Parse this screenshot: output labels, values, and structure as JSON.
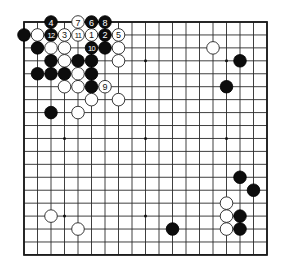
{
  "board": {
    "size": 19,
    "origin_x": 24,
    "origin_y": 22,
    "spacing_x": 13.5,
    "spacing_y": 12.94,
    "stone_radius": 6.3,
    "colors": {
      "background": "#ffffff",
      "grid": "#2a2a2a",
      "black_stone": "#0d0d0d",
      "white_stone": "#ffffff"
    },
    "star_points": [
      [
        3,
        3
      ],
      [
        9,
        3
      ],
      [
        15,
        3
      ],
      [
        3,
        9
      ],
      [
        9,
        9
      ],
      [
        15,
        9
      ],
      [
        3,
        15
      ],
      [
        9,
        15
      ],
      [
        15,
        15
      ]
    ]
  },
  "stones": [
    {
      "color": "black",
      "col": 2,
      "row": 0,
      "label": "4"
    },
    {
      "color": "white",
      "col": 4,
      "row": 0,
      "label": "7"
    },
    {
      "color": "black",
      "col": 5,
      "row": 0,
      "label": "6"
    },
    {
      "color": "black",
      "col": 6,
      "row": 0,
      "label": "8"
    },
    {
      "color": "black",
      "col": 0,
      "row": 1,
      "label": ""
    },
    {
      "color": "white",
      "col": 1,
      "row": 1,
      "label": ""
    },
    {
      "color": "black",
      "col": 2,
      "row": 1,
      "label": "12"
    },
    {
      "color": "white",
      "col": 3,
      "row": 1,
      "label": "3"
    },
    {
      "color": "white",
      "col": 4,
      "row": 1,
      "label": "11"
    },
    {
      "color": "white",
      "col": 5,
      "row": 1,
      "label": "1"
    },
    {
      "color": "black",
      "col": 6,
      "row": 1,
      "label": "2"
    },
    {
      "color": "white",
      "col": 7,
      "row": 1,
      "label": "5"
    },
    {
      "color": "black",
      "col": 1,
      "row": 2,
      "label": ""
    },
    {
      "color": "white",
      "col": 2,
      "row": 2,
      "label": ""
    },
    {
      "color": "white",
      "col": 3,
      "row": 2,
      "label": ""
    },
    {
      "color": "black",
      "col": 5,
      "row": 2,
      "label": "10"
    },
    {
      "color": "black",
      "col": 6,
      "row": 2,
      "label": ""
    },
    {
      "color": "white",
      "col": 7,
      "row": 2,
      "label": ""
    },
    {
      "color": "black",
      "col": 2,
      "row": 3,
      "label": ""
    },
    {
      "color": "white",
      "col": 3,
      "row": 3,
      "label": ""
    },
    {
      "color": "black",
      "col": 4,
      "row": 3,
      "label": ""
    },
    {
      "color": "black",
      "col": 5,
      "row": 3,
      "label": ""
    },
    {
      "color": "white",
      "col": 7,
      "row": 3,
      "label": ""
    },
    {
      "color": "black",
      "col": 1,
      "row": 4,
      "label": ""
    },
    {
      "color": "black",
      "col": 2,
      "row": 4,
      "label": ""
    },
    {
      "color": "black",
      "col": 3,
      "row": 4,
      "label": ""
    },
    {
      "color": "white",
      "col": 4,
      "row": 4,
      "label": ""
    },
    {
      "color": "black",
      "col": 5,
      "row": 4,
      "label": ""
    },
    {
      "color": "white",
      "col": 3,
      "row": 5,
      "label": ""
    },
    {
      "color": "white",
      "col": 4,
      "row": 5,
      "label": ""
    },
    {
      "color": "black",
      "col": 5,
      "row": 5,
      "label": ""
    },
    {
      "color": "white",
      "col": 6,
      "row": 5,
      "label": "9"
    },
    {
      "color": "white",
      "col": 5,
      "row": 6,
      "label": ""
    },
    {
      "color": "white",
      "col": 7,
      "row": 6,
      "label": ""
    },
    {
      "color": "black",
      "col": 2,
      "row": 7,
      "label": ""
    },
    {
      "color": "white",
      "col": 4,
      "row": 7,
      "label": ""
    },
    {
      "color": "white",
      "col": 14,
      "row": 2,
      "label": ""
    },
    {
      "color": "black",
      "col": 16,
      "row": 3,
      "label": ""
    },
    {
      "color": "black",
      "col": 15,
      "row": 5,
      "label": ""
    },
    {
      "color": "black",
      "col": 16,
      "row": 12,
      "label": ""
    },
    {
      "color": "black",
      "col": 17,
      "row": 13,
      "label": ""
    },
    {
      "color": "white",
      "col": 15,
      "row": 14,
      "label": ""
    },
    {
      "color": "white",
      "col": 15,
      "row": 15,
      "label": ""
    },
    {
      "color": "black",
      "col": 16,
      "row": 15,
      "label": ""
    },
    {
      "color": "white",
      "col": 15,
      "row": 16,
      "label": ""
    },
    {
      "color": "black",
      "col": 16,
      "row": 16,
      "label": ""
    },
    {
      "color": "white",
      "col": 2,
      "row": 15,
      "label": ""
    },
    {
      "color": "white",
      "col": 4,
      "row": 16,
      "label": ""
    },
    {
      "color": "black",
      "col": 11,
      "row": 16,
      "label": ""
    }
  ]
}
